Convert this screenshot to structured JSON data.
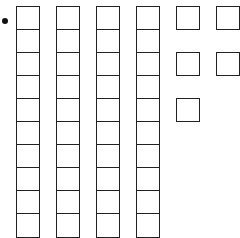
{
  "diagram": {
    "bullet": true,
    "tens_rods": 4,
    "cells_per_rod": 10,
    "ones_units": 5,
    "represented_value": 45,
    "line_color": "#222222"
  }
}
